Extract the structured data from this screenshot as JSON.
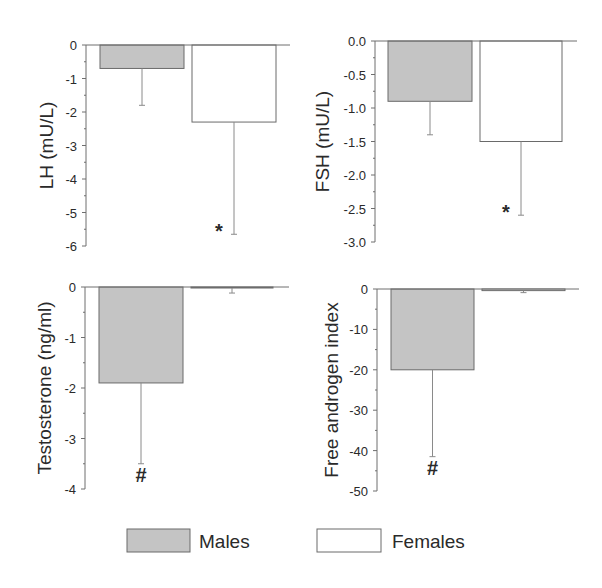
{
  "chart_data": [
    {
      "type": "bar",
      "panel": "top-left",
      "ylabel": "LH (mU/L)",
      "xlabel": "",
      "title": "",
      "categories": [
        "Males",
        "Females"
      ],
      "values": [
        -0.7,
        -2.3
      ],
      "errors": [
        1.1,
        3.35
      ],
      "ylim": [
        -6,
        0
      ],
      "yticks": [
        0,
        -1,
        -2,
        -3,
        -4,
        -5,
        -6
      ],
      "ytick_labels": [
        "0",
        "-1",
        "-2",
        "-3",
        "-4",
        "-5",
        "-6"
      ],
      "annotations": [
        {
          "category": "Females",
          "text": "*"
        }
      ],
      "grid": false
    },
    {
      "type": "bar",
      "panel": "top-right",
      "ylabel": "FSH (mU/L)",
      "xlabel": "",
      "title": "",
      "categories": [
        "Males",
        "Females"
      ],
      "values": [
        -0.9,
        -1.5
      ],
      "errors": [
        0.5,
        1.1
      ],
      "ylim": [
        -3.0,
        0.0
      ],
      "yticks": [
        0.0,
        -0.5,
        -1.0,
        -1.5,
        -2.0,
        -2.5,
        -3.0
      ],
      "ytick_labels": [
        "0.0",
        "-0.5",
        "-1.0",
        "-1.5",
        "-2.0",
        "-2.5",
        "-3.0"
      ],
      "annotations": [
        {
          "category": "Females",
          "text": "*"
        }
      ],
      "grid": false
    },
    {
      "type": "bar",
      "panel": "bottom-left",
      "ylabel": "Testosterone (ng/ml)",
      "xlabel": "",
      "title": "",
      "categories": [
        "Males",
        "Females"
      ],
      "values": [
        -1.9,
        -0.02
      ],
      "errors": [
        1.6,
        0.1
      ],
      "ylim": [
        -4,
        0
      ],
      "yticks": [
        0,
        -1,
        -2,
        -3,
        -4
      ],
      "ytick_labels": [
        "0",
        "-1",
        "-2",
        "-3",
        "-4"
      ],
      "annotations": [
        {
          "category": "Males",
          "text": "#"
        }
      ],
      "grid": false
    },
    {
      "type": "bar",
      "panel": "bottom-right",
      "ylabel": "Free androgen index",
      "xlabel": "",
      "title": "",
      "categories": [
        "Males",
        "Females"
      ],
      "values": [
        -20,
        -0.4
      ],
      "errors": [
        21.5,
        0.5
      ],
      "ylim": [
        -50,
        0
      ],
      "yticks": [
        0,
        -10,
        -20,
        -30,
        -40,
        -50
      ],
      "ytick_labels": [
        "0",
        "-10",
        "-20",
        "-30",
        "-40",
        "-50"
      ],
      "annotations": [
        {
          "category": "Males",
          "text": "#"
        }
      ],
      "grid": false
    }
  ],
  "legend": {
    "position": "bottom",
    "items": [
      {
        "label": "Males",
        "color": "#c4c4c4"
      },
      {
        "label": "Females",
        "color": "#ffffff"
      }
    ]
  },
  "colors": {
    "males_fill": "#c4c4c4",
    "females_fill": "#ffffff",
    "bar_stroke": "#6a6a6a",
    "axis": "#6e6e6e",
    "text": "#2a2a2a"
  }
}
